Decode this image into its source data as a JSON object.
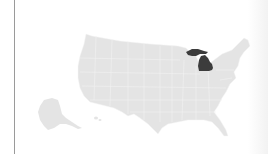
{
  "map": {
    "region": "United States",
    "highlighted_state": "Michigan",
    "colors": {
      "base_fill": "#e4e4e4",
      "state_border": "#f4f4f4",
      "highlight_fill": "#3c3c3c",
      "background": "#ffffff",
      "divider": "#9a9a9a"
    }
  }
}
